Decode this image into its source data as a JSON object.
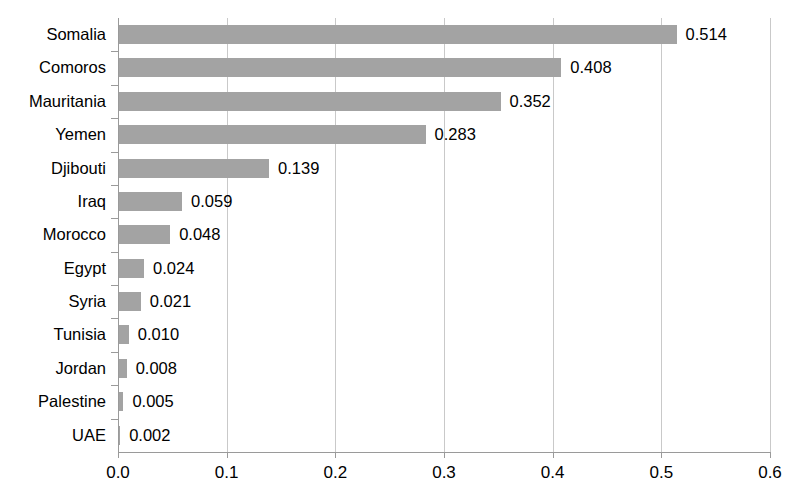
{
  "chart_data": {
    "type": "bar",
    "orientation": "horizontal",
    "title": "",
    "xlabel": "",
    "ylabel": "",
    "xlim": [
      0.0,
      0.6
    ],
    "xticks": [
      "0.0",
      "0.1",
      "0.2",
      "0.3",
      "0.4",
      "0.5",
      "0.6"
    ],
    "xtick_values": [
      0.0,
      0.1,
      0.2,
      0.3,
      0.4,
      0.5,
      0.6
    ],
    "grid": "vertical",
    "legend": "none",
    "bar_color": "#a3a3a3",
    "categories": [
      "Somalia",
      "Comoros",
      "Mauritania",
      "Yemen",
      "Djibouti",
      "Iraq",
      "Morocco",
      "Egypt",
      "Syria",
      "Tunisia",
      "Jordan",
      "Palestine",
      "UAE"
    ],
    "values": [
      0.514,
      0.408,
      0.352,
      0.283,
      0.139,
      0.059,
      0.048,
      0.024,
      0.021,
      0.01,
      0.008,
      0.005,
      0.002
    ],
    "value_labels": [
      "0.514",
      "0.408",
      "0.352",
      "0.283",
      "0.139",
      "0.059",
      "0.048",
      "0.024",
      "0.021",
      "0.010",
      "0.008",
      "0.005",
      "0.002"
    ]
  }
}
